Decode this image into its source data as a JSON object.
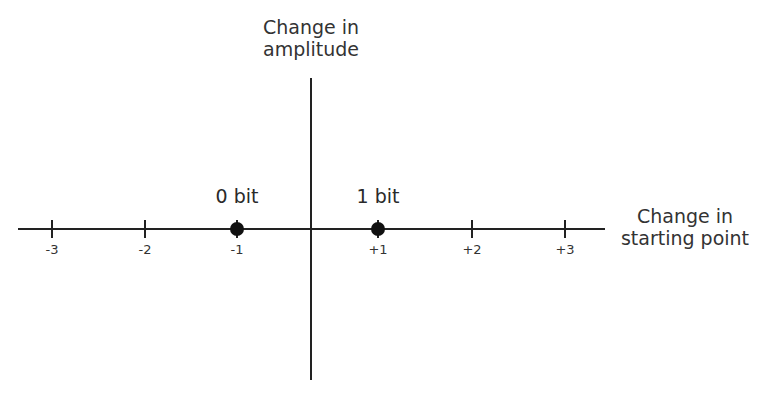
{
  "diagram": {
    "y_axis_title_line1": "Change in",
    "y_axis_title_line2": "amplitude",
    "x_axis_title_line1": "Change in",
    "x_axis_title_line2": "starting point",
    "ticks": [
      {
        "label": "-3",
        "x": 52
      },
      {
        "label": "-2",
        "x": 145
      },
      {
        "label": "-1",
        "x": 237
      },
      {
        "label": "+1",
        "x": 378
      },
      {
        "label": "+2",
        "x": 472
      },
      {
        "label": "+3",
        "x": 565
      }
    ],
    "points": [
      {
        "label": "0 bit",
        "value": -1,
        "x": 237
      },
      {
        "label": "1 bit",
        "value": 1,
        "x": 378
      }
    ],
    "colors": {
      "line": "#222222",
      "dot": "#111111",
      "text": "#333333"
    }
  }
}
